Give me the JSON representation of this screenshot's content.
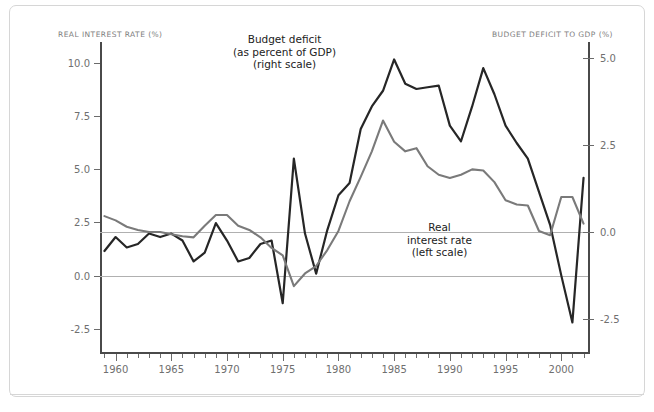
{
  "chart_data": {
    "type": "line",
    "title": "",
    "xlabel": "",
    "x": [
      1959,
      1960,
      1961,
      1962,
      1963,
      1964,
      1965,
      1966,
      1967,
      1968,
      1969,
      1970,
      1971,
      1972,
      1973,
      1974,
      1975,
      1976,
      1977,
      1978,
      1979,
      1980,
      1981,
      1982,
      1983,
      1984,
      1985,
      1986,
      1987,
      1988,
      1989,
      1990,
      1991,
      1992,
      1993,
      1994,
      1995,
      1996,
      1997,
      1998,
      1999,
      2000,
      2001,
      2002
    ],
    "xlim": [
      1958.6,
      2002.4
    ],
    "grid": true,
    "legend_position": "inline-annotations",
    "axes": {
      "left": {
        "label": "REAL INTEREST RATE (%)",
        "ticks": [
          "10.0",
          "7.5",
          "5.0",
          "2.5",
          "0.0",
          "-2.5"
        ],
        "tick_values": [
          10.0,
          7.5,
          5.0,
          2.5,
          0.0,
          -2.5
        ],
        "lim": [
          -3.6,
          11.0
        ]
      },
      "right": {
        "label": "BUDGET DEFICIT TO GDP (%)",
        "ticks": [
          "5.0",
          "2.5",
          "0.0",
          "-2.5"
        ],
        "tick_values": [
          5.0,
          2.5,
          0.0,
          -2.5
        ],
        "lim": [
          -3.45,
          5.45
        ]
      }
    },
    "xticks_major": [
      1960,
      1965,
      1970,
      1975,
      1980,
      1985,
      1990,
      1995,
      2000
    ],
    "xtick_labels": [
      "1960",
      "1965",
      "1970",
      "1975",
      "1980",
      "1985",
      "1990",
      "1995",
      "2000"
    ],
    "series": [
      {
        "name": "Budget deficit (as percent of GDP)",
        "scale": "right",
        "color": "#262626",
        "annotation": [
          "Budget deficit",
          "(as percent of GDP)",
          "(right scale)"
        ],
        "values": [
          -0.55,
          -0.15,
          -0.45,
          -0.35,
          -0.05,
          -0.15,
          -0.05,
          -0.25,
          -0.85,
          -0.6,
          0.25,
          -0.25,
          -0.85,
          -0.75,
          -0.35,
          -0.25,
          -2.05,
          2.1,
          -0.05,
          -1.2,
          0.05,
          1.05,
          1.4,
          2.95,
          3.6,
          4.05,
          4.95,
          4.25,
          4.1,
          4.15,
          4.2,
          3.05,
          2.6,
          3.6,
          4.7,
          3.95,
          3.05,
          2.55,
          2.1,
          1.15,
          0.2,
          -1.25,
          -2.6,
          1.55
        ]
      },
      {
        "name": "Real interest rate",
        "scale": "left",
        "color": "#7a7a7a",
        "annotation": [
          "Real",
          "interest rate",
          "(left scale)"
        ],
        "values": [
          2.8,
          2.6,
          2.3,
          2.15,
          2.05,
          2.05,
          1.95,
          1.85,
          1.8,
          2.35,
          2.85,
          2.85,
          2.35,
          2.15,
          1.8,
          1.3,
          1.25,
          0.95,
          -0.5,
          0.1,
          0.45,
          1.2,
          2.1,
          3.5,
          4.65,
          5.85,
          7.3,
          6.3,
          5.85,
          6.0,
          5.15,
          4.75,
          4.6,
          4.75,
          5.0,
          4.95,
          4.4,
          3.55,
          3.35,
          3.3,
          2.1,
          1.9,
          3.7,
          3.7
        ]
      }
    ],
    "series_corrected": {
      "real_interest_rate": [
        2.8,
        2.6,
        2.3,
        2.15,
        2.05,
        2.05,
        1.95,
        1.85,
        1.8,
        2.35,
        2.85,
        2.85,
        2.35,
        2.15,
        1.8,
        1.3,
        0.95,
        -0.5,
        0.1,
        0.45,
        1.2,
        2.1,
        3.5,
        4.65,
        5.85,
        7.3,
        6.3,
        5.85,
        6.0,
        5.15,
        4.75,
        4.6,
        4.75,
        5.0,
        4.95,
        4.4,
        3.55,
        3.35,
        3.3,
        2.1,
        1.9,
        3.7,
        3.7,
        2.45
      ]
    }
  }
}
